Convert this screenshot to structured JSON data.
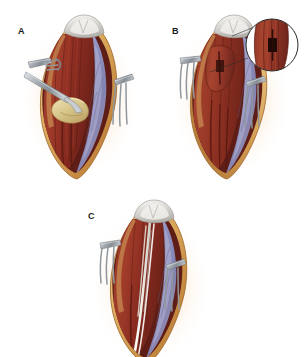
{
  "figure": {
    "background_color": "#ffffff",
    "width": 305,
    "height": 357,
    "panel_count": 3
  },
  "palette": {
    "background": "#ffffff",
    "glow_halo": "#f6c79a",
    "skin_edge_light": "#e8c27a",
    "skin_edge_dark": "#c8924a",
    "subcutaneous_fat": "#d8a85c",
    "muscle_dark_red": "#7d2a22",
    "muscle_mid_red": "#9e3a2c",
    "muscle_bright_red": "#b8472f",
    "fascia_blue": "#8e8fba",
    "fascia_blue_light": "#a9a9cd",
    "bone_patella": "#d8d6d2",
    "bone_patella_highlight": "#f2f1ee",
    "tendon_graft_yellow": "#ded0a0",
    "instrument_steel": "#9aa0a6",
    "instrument_steel_light": "#d4d8dc",
    "instrument_steel_dark": "#6b7278",
    "suture_white": "#f4f4f0",
    "inset_outline": "#2b2b2b",
    "leader_line": "#2b2b2b",
    "label_text": "#1a1a1a"
  },
  "panels": [
    {
      "id": "A",
      "label": "A",
      "label_x": 18,
      "label_y": 26,
      "caption": "Longitudinal incision with rake retractors; elevator mobilizes the tendon graft",
      "has_inset": false,
      "has_sutures": false,
      "has_elevator": true,
      "has_graft": true,
      "retractor_count": 2,
      "retractor_prongs": 3
    },
    {
      "id": "B",
      "label": "B",
      "label_x": 172,
      "label_y": 26,
      "caption": "Exposure maintained; magnified inset shows the slit incision in the muscle belly",
      "has_inset": true,
      "has_sutures": false,
      "has_elevator": false,
      "has_graft": false,
      "retractor_count": 2,
      "retractor_prongs": 3
    },
    {
      "id": "C",
      "label": "C",
      "label_x": 88,
      "label_y": 211,
      "caption": "Completed repair with longitudinal suture strands in place",
      "has_inset": false,
      "has_sutures": true,
      "has_elevator": false,
      "has_graft": false,
      "retractor_count": 2,
      "retractor_prongs": 3
    }
  ],
  "inset": {
    "panel": "B",
    "shape": "circle",
    "center_x": 272,
    "center_y": 45,
    "radius": 27,
    "outline_color": "#2b2b2b",
    "outline_width": 1,
    "contents": "magnified muscle belly with dark slit incision",
    "leader_from_x": 210,
    "leader_from_y": 72,
    "leader_to_x": 248,
    "leader_to_y": 58
  },
  "anatomy_labels": {
    "bone": "patella",
    "muscle": "quadriceps muscle belly",
    "fascia": "fascia lata / retinaculum",
    "skin": "skin and subcutaneous edge",
    "graft": "tendon graft",
    "suture": "suture strand"
  },
  "instruments": {
    "retractor": "three-prong rake retractor",
    "elevator": "periosteal elevator"
  }
}
